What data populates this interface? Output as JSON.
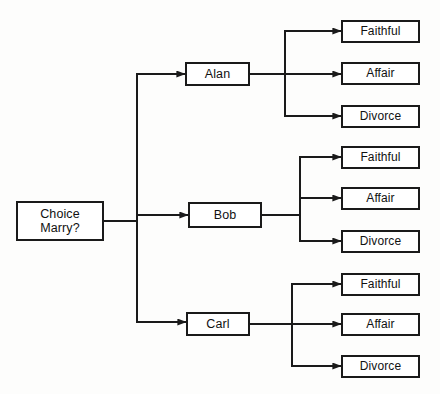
{
  "diagram": {
    "style": {
      "background": "#fdfdfc",
      "line_color": "#1a1a1a",
      "box_fill": "#ffffff",
      "text_color": "#111111"
    },
    "root": {
      "id": "root",
      "line1": "Choice",
      "line2": "Marry?"
    },
    "choices": [
      {
        "id": "alan",
        "label": "Alan"
      },
      {
        "id": "bob",
        "label": "Bob"
      },
      {
        "id": "carl",
        "label": "Carl"
      }
    ],
    "outcomes": [
      {
        "id": "alan-faithful",
        "parent": "alan",
        "label": "Faithful"
      },
      {
        "id": "alan-affair",
        "parent": "alan",
        "label": "Affair"
      },
      {
        "id": "alan-divorce",
        "parent": "alan",
        "label": "Divorce"
      },
      {
        "id": "bob-faithful",
        "parent": "bob",
        "label": "Faithful"
      },
      {
        "id": "bob-affair",
        "parent": "bob",
        "label": "Affair"
      },
      {
        "id": "bob-divorce",
        "parent": "bob",
        "label": "Divorce"
      },
      {
        "id": "carl-faithful",
        "parent": "carl",
        "label": "Faithful"
      },
      {
        "id": "carl-affair",
        "parent": "carl",
        "label": "Affair"
      },
      {
        "id": "carl-divorce",
        "parent": "carl",
        "label": "Divorce"
      }
    ]
  }
}
